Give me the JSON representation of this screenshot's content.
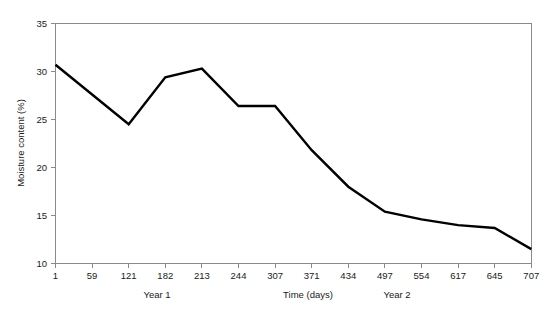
{
  "chart_data": {
    "type": "line",
    "title": "",
    "xlabel": "Time (days)",
    "ylabel": "Moisture content (%)",
    "x": [
      1,
      59,
      121,
      182,
      213,
      244,
      307,
      371,
      434,
      497,
      554,
      617,
      645,
      707
    ],
    "xtick_labels": [
      "1",
      "59",
      "121",
      "182",
      "213",
      "244",
      "307",
      "371",
      "434",
      "497",
      "554",
      "617",
      "645",
      "707"
    ],
    "values": [
      30.7,
      27.6,
      24.5,
      29.4,
      30.3,
      26.4,
      26.4,
      21.8,
      18.0,
      15.4,
      14.6,
      14.0,
      13.7,
      11.5
    ],
    "ylim": [
      10,
      35
    ],
    "ytick_labels": [
      "10",
      "15",
      "20",
      "25",
      "30",
      "35"
    ],
    "yticks": [
      10,
      15,
      20,
      25,
      30,
      35
    ],
    "grid": false,
    "legend": "none",
    "series": [
      {
        "name": "Moisture content",
        "color": "#000000",
        "values": [
          30.7,
          27.6,
          24.5,
          29.4,
          30.3,
          26.4,
          26.4,
          21.8,
          18.0,
          15.4,
          14.6,
          14.0,
          13.7,
          11.5
        ]
      }
    ],
    "annotations": [
      {
        "text": "Year 1",
        "x_label": "182"
      },
      {
        "text": "Year 2",
        "x_label": "497"
      }
    ]
  },
  "axes": {
    "y_title": "Moisture content (%)",
    "x_title": "Time (days)"
  },
  "period_labels": {
    "year1": "Year 1",
    "year2": "Year 2"
  },
  "colors": {
    "line": "#000000",
    "axis": "#8a8a8a",
    "background": "#ffffff"
  }
}
